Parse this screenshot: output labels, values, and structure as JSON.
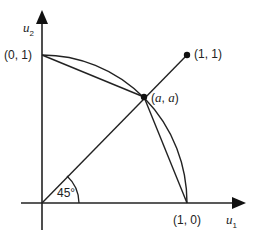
{
  "diagram": {
    "axes": {
      "x_label": "u",
      "x_label_sub": "1",
      "y_label": "u",
      "y_label_sub": "2"
    },
    "points": {
      "p01": "(0, 1)",
      "p10": "(1, 0)",
      "p11": "(1, 1)",
      "paa_open": "(",
      "paa_a1": "a",
      "paa_sep": ", ",
      "paa_a2": "a",
      "paa_close": ")"
    },
    "angle_label": "45°",
    "colors": {
      "stroke": "#222222",
      "background": "#ffffff"
    }
  }
}
